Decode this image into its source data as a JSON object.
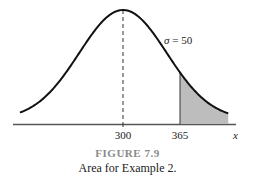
{
  "chart_data": {
    "type": "area",
    "title": "",
    "distribution": "normal",
    "mean": 300,
    "sigma": 50,
    "sigma_label_symbol": "σ",
    "sigma_label_value": "= 50",
    "xlabel": "x",
    "ylabel": "",
    "tick_labels": [
      "300",
      "365"
    ],
    "ticks": [
      300,
      365
    ],
    "shaded_region": {
      "from": 365,
      "to": "∞",
      "color": "#bdbdbd",
      "description": "Upper tail area x > 365"
    },
    "mean_line": {
      "x": 300,
      "style": "dashed"
    },
    "grid": false,
    "legend": null
  },
  "caption": {
    "figure_number": "FIGURE 7.9",
    "text": "Area for Example 2."
  },
  "colors": {
    "curve": "#111111",
    "shade": "#bdbdbd",
    "axis": "#555555",
    "caption_number": "#8a8a8a"
  }
}
